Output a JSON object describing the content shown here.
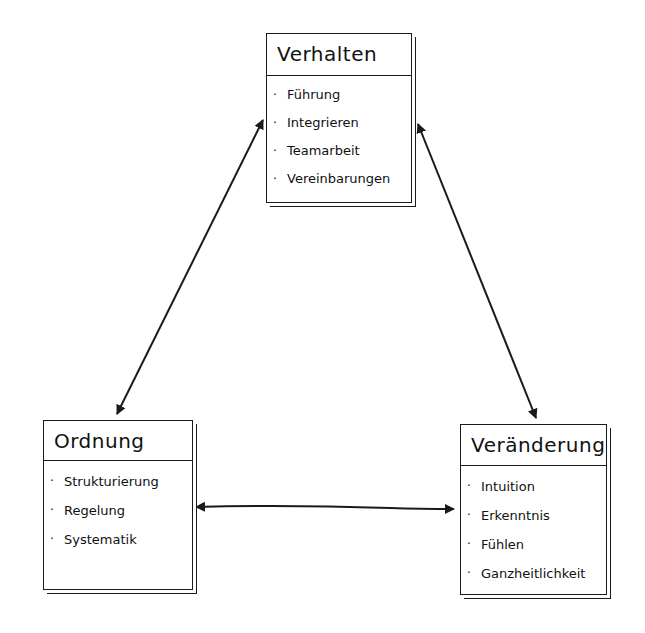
{
  "diagram": {
    "type": "hand-drawn triangle concept diagram",
    "nodes": [
      {
        "id": "verhalten",
        "title": "Verhalten",
        "items": [
          "Führung",
          "Integrieren",
          "Teamarbeit",
          "Vereinbarungen"
        ]
      },
      {
        "id": "ordnung",
        "title": "Ordnung",
        "items": [
          "Strukturierung",
          "Regelung",
          "Systematik"
        ]
      },
      {
        "id": "veraenderung",
        "title": "Veränderung",
        "items": [
          "Intuition",
          "Erkenntnis",
          "Fühlen",
          "Ganzheitlichkeit"
        ]
      }
    ],
    "edges": [
      {
        "from": "verhalten",
        "to": "ordnung",
        "direction": "bidirectional"
      },
      {
        "from": "verhalten",
        "to": "veraenderung",
        "direction": "bidirectional"
      },
      {
        "from": "ordnung",
        "to": "veraenderung",
        "direction": "bidirectional"
      }
    ],
    "bullet": "·",
    "colors": {
      "ink": "#1a1a1a",
      "background": "#ffffff"
    }
  }
}
